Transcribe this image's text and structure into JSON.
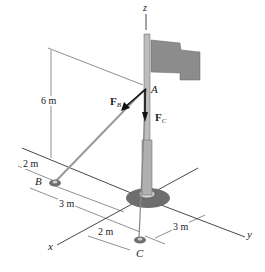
{
  "figure": {
    "axes": {
      "x": "x",
      "y": "y",
      "z": "z"
    },
    "points": {
      "A": "A",
      "B": "B",
      "C": "C"
    },
    "forces": {
      "FB": {
        "main": "F",
        "sub": "B"
      },
      "FC": {
        "main": "F",
        "sub": "C"
      }
    },
    "dimensions": {
      "height": "6 m",
      "b_offset": "2 m",
      "b_to_axis": "3 m",
      "c_offset": "2 m",
      "c_to_axis": "3 m"
    },
    "colors": {
      "flag": "#8c8c8c",
      "pole": "#b5b5b5",
      "base": "#6e6e6e",
      "lines": "#333333",
      "cable": "#999999"
    }
  }
}
